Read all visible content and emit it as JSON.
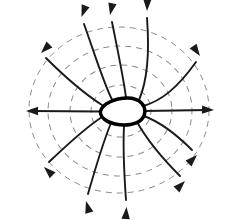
{
  "figure": {
    "background_color": "#ffffff",
    "width": 230,
    "height": 220,
    "center": {
      "x": 120,
      "y": 110
    }
  },
  "conductor": {
    "name": "charged-conductor-blob",
    "description": "Irregular closed conductor outline, pointed at left, rounded at right",
    "stroke_color": "#000000",
    "fill_color": "#ffffff",
    "stroke_width": 3.4,
    "path": "M 100.5 111.5 C 101.5 106.5 108.0 101.0 118.0 99.0 C 128.0 97.0 137.0 98.2 141.5 103.0 C 146.0 107.8 146.0 115.0 141.5 119.5 C 136.5 124.5 126.0 126.3 115.0 124.0 C 106.0 122.1 100.0 117.0 100.5 111.5 Z"
  },
  "equipotentials": {
    "name": "equipotential-surfaces",
    "stroke_color": "#8a8a8a",
    "stroke_width": 1,
    "dash_pattern": "6 5",
    "count": 4,
    "ellipses": [
      {
        "label": "V1",
        "cx": 121,
        "cy": 111,
        "rx": 30,
        "ry": 26,
        "rotate": -4
      },
      {
        "label": "V2",
        "cx": 121,
        "cy": 111,
        "rx": 51,
        "ry": 46,
        "rotate": -3
      },
      {
        "label": "V3",
        "cx": 120,
        "cy": 111,
        "rx": 72,
        "ry": 65,
        "rotate": -2
      },
      {
        "label": "V4",
        "cx": 119,
        "cy": 110,
        "rx": 90,
        "ry": 83,
        "rotate": 0
      }
    ]
  },
  "field_lines": {
    "name": "electric-field-lines",
    "stroke_color": "#1a1a1a",
    "stroke_width": 1.9,
    "direction": "outward",
    "count": 12,
    "lines": [
      {
        "label": "E-right",
        "angle_deg": 0,
        "path": "M 144 111 L 208 110",
        "tip": {
          "x": 214,
          "y": 110
        },
        "tip_angle": 358
      },
      {
        "label": "E-upper-right-shallow",
        "angle_deg": 32,
        "path": "M 143.5 106 C 160 101 176 90 196 62",
        "tip": {
          "x": 200,
          "y": 56
        },
        "tip_angle": 305
      },
      {
        "label": "E-upper-right-mid",
        "angle_deg": 58,
        "path": "M 139 100 C 146 84 150 58 147 18",
        "tip": {
          "x": 147,
          "y": 11
        },
        "tip_angle": 268
      },
      {
        "label": "E-up-slight-left",
        "angle_deg": 80,
        "path": "M 126 98 C 124 80 118 52 112 22",
        "tip": {
          "x": 110,
          "y": 15
        },
        "tip_angle": 258
      },
      {
        "label": "E-upper-left-mid",
        "angle_deg": 108,
        "path": "M 112 99.5 C 104 84 94 52 84 24",
        "tip": {
          "x": 81.5,
          "y": 17
        },
        "tip_angle": 250
      },
      {
        "label": "E-upper-left-steep",
        "angle_deg": 140,
        "path": "M 102 105 C 88 96 68 80 46 58",
        "tip": {
          "x": 41,
          "y": 53
        },
        "tip_angle": 225
      },
      {
        "label": "E-left",
        "angle_deg": 180,
        "path": "M 100 111.5 L 32 111",
        "tip": {
          "x": 26,
          "y": 111
        },
        "tip_angle": 180
      },
      {
        "label": "E-lower-left-steep",
        "angle_deg": 220,
        "path": "M 102 117 C 88 126 70 142 49 162",
        "tip": {
          "x": 44,
          "y": 167
        },
        "tip_angle": 136
      },
      {
        "label": "E-lower-left-mid",
        "angle_deg": 250,
        "path": "M 111 123 C 104 140 96 166 88 194",
        "tip": {
          "x": 86,
          "y": 201
        },
        "tip_angle": 106
      },
      {
        "label": "E-down-slight-left",
        "angle_deg": 272,
        "path": "M 124 125.5 C 123 146 124 172 126 200",
        "tip": {
          "x": 126.5,
          "y": 207
        },
        "tip_angle": 86
      },
      {
        "label": "E-lower-right-mid",
        "angle_deg": 300,
        "path": "M 137 122 C 146 138 160 156 180 176",
        "tip": {
          "x": 185,
          "y": 181
        },
        "tip_angle": 45
      },
      {
        "label": "E-lower-right-shallow",
        "angle_deg": 330,
        "path": "M 144 116 C 160 122 176 134 192 150",
        "tip": {
          "x": 197,
          "y": 155
        },
        "tip_angle": 45
      }
    ]
  }
}
